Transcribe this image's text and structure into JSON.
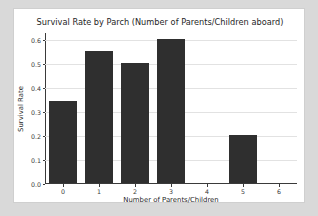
{
  "chart_data": {
    "type": "bar",
    "title": "Survival Rate by Parch (Number of Parents/Children aboard)",
    "xlabel": "Number of Parents/Children",
    "ylabel": "Survival Rate",
    "categories": [
      "0",
      "1",
      "2",
      "3",
      "4",
      "5",
      "6"
    ],
    "values": [
      0.3437,
      0.5508,
      0.5,
      0.6,
      0.0,
      0.2,
      0.0
    ],
    "xlim": [
      -0.5,
      6.5
    ],
    "ylim": [
      0.0,
      0.63
    ],
    "ytick_labels": [
      "0.0",
      "0.1",
      "0.2",
      "0.3",
      "0.4",
      "0.5",
      "0.6"
    ],
    "ytick_values": [
      0.0,
      0.1,
      0.2,
      0.3,
      0.4,
      0.5,
      0.6
    ],
    "xtick_labels": [
      "0",
      "1",
      "2",
      "3",
      "4",
      "5",
      "6"
    ],
    "grid": "horizontal",
    "legend": "none",
    "bar_color": "#2f2f2f",
    "grid_color": "#e2e2e2",
    "axis_color": "#3a3a3a",
    "plot_background": "#ffffff",
    "figure_background": "#ffffff",
    "page_background": "#d9d9d9"
  }
}
